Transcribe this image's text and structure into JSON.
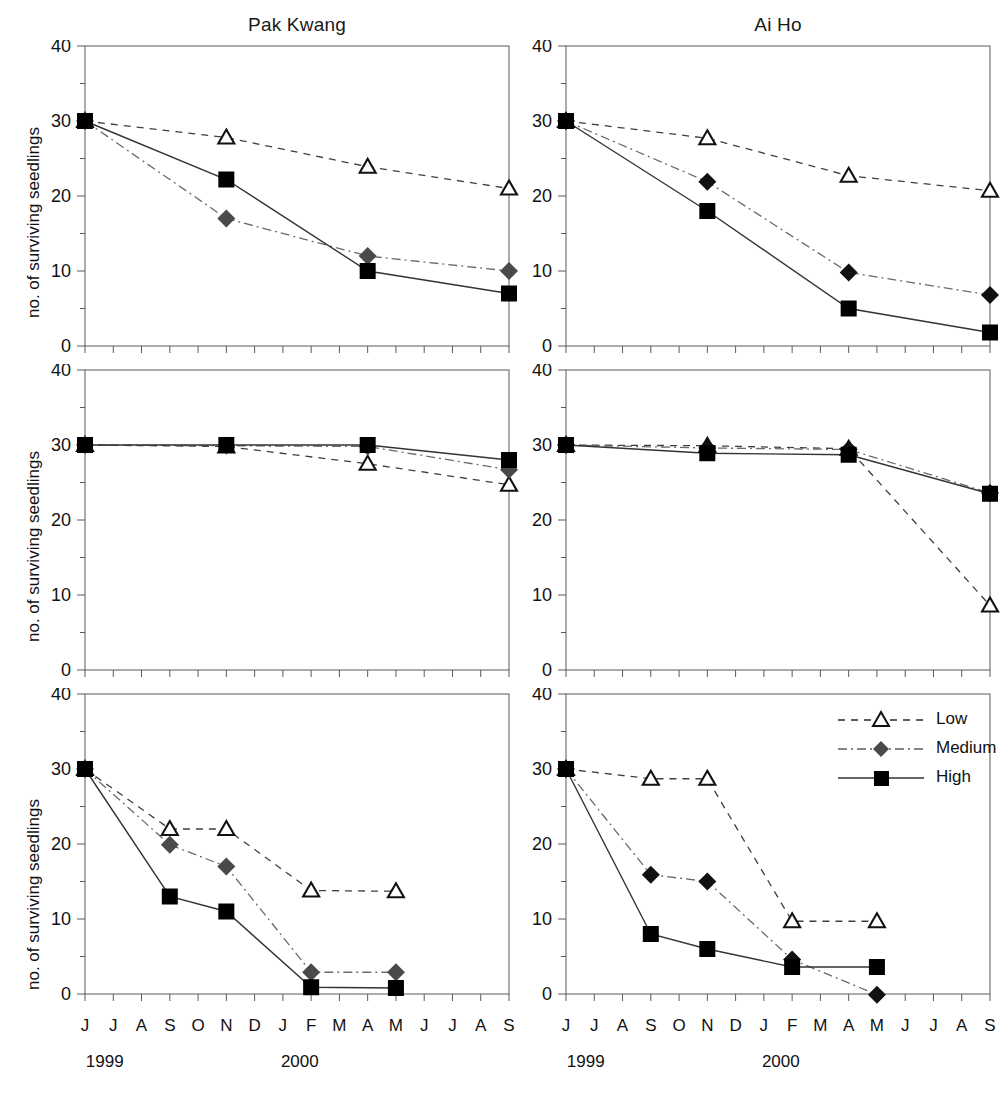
{
  "figure": {
    "width": 1004,
    "height": 1099,
    "columns": [
      {
        "key": "pak_kwang",
        "title": "Pak Kwang"
      },
      {
        "key": "ai_ho",
        "title": "Ai Ho"
      }
    ],
    "y_axis_label": "no. of surviving seedlings",
    "month_ticks": [
      "J",
      "J",
      "A",
      "S",
      "O",
      "N",
      "D",
      "J",
      "F",
      "M",
      "A",
      "M",
      "J",
      "J",
      "A",
      "S"
    ],
    "year_labels": [
      {
        "text": "1999",
        "at_index": 0.7
      },
      {
        "text": "2000",
        "at_index": 7.6
      }
    ],
    "y_ticks_major": [
      "0",
      "10",
      "20",
      "30",
      "40"
    ],
    "colors": {
      "axis": "#5a5a5a",
      "low": "#2b2b2b",
      "medium_pak": "#4a4a4a",
      "medium_ai": "#111111",
      "high": "#000000",
      "text": "#111111"
    },
    "legend": {
      "items": [
        {
          "label": "Low",
          "marker": "open-triangle-icon",
          "line": "dashed"
        },
        {
          "label": "Medium",
          "marker": "filled-diamond-icon",
          "line": "dash-dot"
        },
        {
          "label": "High",
          "marker": "filled-square-icon",
          "line": "solid"
        }
      ]
    }
  },
  "chart_data": [
    {
      "type": "line",
      "panel": "row1-col1",
      "site": "Pak Kwang",
      "title": "Avicennia alba",
      "xlabel": "",
      "ylabel": "no. of surviving seedlings",
      "ylim": [
        0,
        40
      ],
      "yticks": [
        0,
        10,
        20,
        30,
        40
      ],
      "x": [
        "J",
        "J",
        "A",
        "S",
        "O",
        "N",
        "D",
        "J",
        "F",
        "M",
        "A",
        "M",
        "J",
        "J",
        "A",
        "S"
      ],
      "x_years": [
        "1999",
        "1999",
        "1999",
        "1999",
        "1999",
        "1999",
        "1999",
        "2000",
        "2000",
        "2000",
        "2000",
        "2000",
        "2000",
        "2000",
        "2000",
        "2000"
      ],
      "grid": false,
      "legend_position": "none",
      "series": [
        {
          "name": "Low",
          "x_index": [
            0,
            5,
            10,
            15
          ],
          "values": [
            30,
            27.8,
            23.9,
            21.0
          ]
        },
        {
          "name": "Medium",
          "x_index": [
            0,
            5,
            10,
            15
          ],
          "values": [
            30,
            17.0,
            12.0,
            10.0
          ]
        },
        {
          "name": "High",
          "x_index": [
            0,
            5,
            10,
            15
          ],
          "values": [
            30,
            22.2,
            10.0,
            7.0
          ]
        }
      ]
    },
    {
      "type": "line",
      "panel": "row1-col2",
      "site": "Ai Ho",
      "title": "Avicennia alba",
      "xlabel": "",
      "ylabel": "no. of surviving seedlings",
      "ylim": [
        0,
        40
      ],
      "yticks": [
        0,
        10,
        20,
        30,
        40
      ],
      "x": [
        "J",
        "J",
        "A",
        "S",
        "O",
        "N",
        "D",
        "J",
        "F",
        "M",
        "A",
        "M",
        "J",
        "J",
        "A",
        "S"
      ],
      "grid": false,
      "legend_position": "none",
      "series": [
        {
          "name": "Low",
          "x_index": [
            0,
            5,
            10,
            15
          ],
          "values": [
            30,
            27.7,
            22.7,
            20.7
          ]
        },
        {
          "name": "Medium",
          "x_index": [
            0,
            5,
            10,
            15
          ],
          "values": [
            30,
            21.9,
            9.8,
            6.8
          ]
        },
        {
          "name": "High",
          "x_index": [
            0,
            5,
            10,
            15
          ],
          "values": [
            30,
            18.0,
            5.0,
            1.8
          ]
        }
      ]
    },
    {
      "type": "line",
      "panel": "row2-col1",
      "site": "Pak Kwang",
      "title": "Rhizophora mucronata",
      "xlabel": "",
      "ylabel": "no. of surviving seedlings",
      "ylim": [
        0,
        40
      ],
      "yticks": [
        0,
        10,
        20,
        30,
        40
      ],
      "x": [
        "J",
        "J",
        "A",
        "S",
        "O",
        "N",
        "D",
        "J",
        "F",
        "M",
        "A",
        "M",
        "J",
        "J",
        "A",
        "S"
      ],
      "grid": false,
      "legend_position": "none",
      "series": [
        {
          "name": "Low",
          "x_index": [
            0,
            5,
            10,
            15
          ],
          "values": [
            30,
            29.8,
            27.5,
            24.7
          ]
        },
        {
          "name": "Medium",
          "x_index": [
            0,
            5,
            10,
            15
          ],
          "values": [
            30,
            29.9,
            29.8,
            26.7
          ]
        },
        {
          "name": "High",
          "x_index": [
            0,
            5,
            10,
            15
          ],
          "values": [
            30,
            30.0,
            30.0,
            28.0
          ]
        }
      ]
    },
    {
      "type": "line",
      "panel": "row2-col2",
      "site": "Ai Ho",
      "title": "Rhizophora mucronata",
      "xlabel": "",
      "ylabel": "no. of surviving seedlings",
      "ylim": [
        0,
        40
      ],
      "yticks": [
        0,
        10,
        20,
        30,
        40
      ],
      "x": [
        "J",
        "J",
        "A",
        "S",
        "O",
        "N",
        "D",
        "J",
        "F",
        "M",
        "A",
        "M",
        "J",
        "J",
        "A",
        "S"
      ],
      "grid": false,
      "legend_position": "none",
      "series": [
        {
          "name": "Low",
          "x_index": [
            0,
            5,
            10,
            15
          ],
          "values": [
            30,
            29.9,
            29.5,
            8.6
          ]
        },
        {
          "name": "Medium",
          "x_index": [
            0,
            5,
            10,
            15
          ],
          "values": [
            30,
            29.6,
            29.4,
            23.6
          ]
        },
        {
          "name": "High",
          "x_index": [
            0,
            5,
            10,
            15
          ],
          "values": [
            30,
            28.9,
            28.7,
            23.5
          ]
        }
      ]
    },
    {
      "type": "line",
      "panel": "row3-col1",
      "site": "Pak Kwang",
      "title": "Sonneratia caseolaris",
      "xlabel": "",
      "ylabel": "no. of surviving seedlings",
      "ylim": [
        0,
        40
      ],
      "yticks": [
        0,
        10,
        20,
        30,
        40
      ],
      "x": [
        "J",
        "J",
        "A",
        "S",
        "O",
        "N",
        "D",
        "J",
        "F",
        "M",
        "A",
        "M",
        "J",
        "J",
        "A",
        "S"
      ],
      "grid": false,
      "legend_position": "none",
      "series": [
        {
          "name": "Low",
          "x_index": [
            0,
            3,
            5,
            8,
            11
          ],
          "values": [
            30,
            22.0,
            22.0,
            13.8,
            13.7
          ]
        },
        {
          "name": "Medium",
          "x_index": [
            0,
            3,
            5,
            8,
            11
          ],
          "values": [
            30,
            19.9,
            17.0,
            2.9,
            2.9
          ]
        },
        {
          "name": "High",
          "x_index": [
            0,
            3,
            5,
            8,
            11
          ],
          "values": [
            30,
            13.0,
            11.0,
            0.9,
            0.8
          ]
        }
      ]
    },
    {
      "type": "line",
      "panel": "row3-col2",
      "site": "Ai Ho",
      "title": "Sonneratia caseolaris",
      "xlabel": "",
      "ylabel": "no. of surviving seedlings",
      "ylim": [
        0,
        40
      ],
      "yticks": [
        0,
        10,
        20,
        30,
        40
      ],
      "x": [
        "J",
        "J",
        "A",
        "S",
        "O",
        "N",
        "D",
        "J",
        "F",
        "M",
        "A",
        "M",
        "J",
        "J",
        "A",
        "S"
      ],
      "grid": false,
      "legend_position": "top-right",
      "series": [
        {
          "name": "Low",
          "x_index": [
            0,
            3,
            5,
            8,
            11
          ],
          "values": [
            30,
            28.7,
            28.7,
            9.7,
            9.7
          ]
        },
        {
          "name": "Medium",
          "x_index": [
            0,
            3,
            5,
            8,
            11
          ],
          "values": [
            30,
            15.9,
            15.0,
            4.6,
            -0.1
          ]
        },
        {
          "name": "High",
          "x_index": [
            0,
            3,
            5,
            8,
            11
          ],
          "values": [
            30,
            8.0,
            6.0,
            3.6,
            3.6
          ]
        }
      ]
    }
  ]
}
